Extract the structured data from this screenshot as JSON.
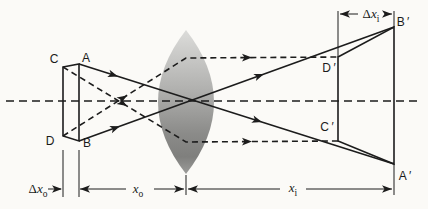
{
  "figure": {
    "canvas": {
      "width": 428,
      "height": 209,
      "background": "#fbfaf7"
    },
    "style": {
      "ink": "#1c1c1c",
      "thin_stroke": 1,
      "main_stroke": 1.6,
      "dash_ray": "6 4",
      "dash_axis": "8 5",
      "arrow_len": 10,
      "arrow_halfwidth": 3.8,
      "lens_gradient": [
        {
          "offset": "0%",
          "color": "#dcdcda"
        },
        {
          "offset": "40%",
          "color": "#b2b2b0"
        },
        {
          "offset": "72%",
          "color": "#8b8b89"
        },
        {
          "offset": "88%",
          "color": "#7f7f7d"
        },
        {
          "offset": "100%",
          "color": "#9c9c9a"
        }
      ]
    },
    "lens": {
      "name": "lens",
      "cx": 186,
      "top": 30,
      "bottom": 174,
      "half_width": 28
    },
    "axis": {
      "name": "optical-axis",
      "y": 101,
      "x1": 6,
      "x2": 422
    },
    "shapes": [
      {
        "name": "object-outline",
        "path": [
          [
            63,
            67
          ],
          [
            79,
            64
          ],
          [
            79,
            141
          ],
          [
            63,
            136
          ]
        ],
        "closed": true
      },
      {
        "name": "image-outline",
        "path": [
          [
            338,
            57
          ],
          [
            394,
            27
          ],
          [
            394,
            164
          ],
          [
            338,
            141
          ]
        ],
        "closed": true
      }
    ],
    "rays": [
      {
        "name": "ray-A-to-A-prime",
        "style": "solid",
        "points": [
          [
            79,
            64
          ],
          [
            394,
            164
          ]
        ],
        "arrows_x": [
          118,
          262
        ]
      },
      {
        "name": "ray-B-to-B-prime",
        "style": "solid",
        "points": [
          [
            79,
            141
          ],
          [
            394,
            27
          ]
        ],
        "arrows_x": [
          120,
          264
        ]
      },
      {
        "name": "ray-C-through-focus",
        "style": "dashed",
        "points": [
          [
            63,
            67
          ],
          [
            186,
            142
          ],
          [
            338,
            141
          ]
        ],
        "arrows_x": [
          127,
          252
        ]
      },
      {
        "name": "ray-D-through-focus",
        "style": "dashed",
        "points": [
          [
            63,
            136
          ],
          [
            186,
            58
          ],
          [
            338,
            57
          ]
        ],
        "arrows_x": [
          127,
          252
        ]
      }
    ],
    "extension_lines": [
      {
        "name": "ext-object-back-face",
        "x1": 63,
        "y1": 150,
        "x2": 63,
        "y2": 197
      },
      {
        "name": "ext-object-front-face",
        "x1": 79,
        "y1": 150,
        "x2": 79,
        "y2": 197
      },
      {
        "name": "ext-lens-center",
        "x1": 186,
        "y1": 175,
        "x2": 186,
        "y2": 195
      },
      {
        "name": "ext-image-front-face",
        "x1": 338,
        "y1": 11,
        "x2": 338,
        "y2": 57
      },
      {
        "name": "ext-image-back-top",
        "x1": 394,
        "y1": 11,
        "x2": 394,
        "y2": 27
      },
      {
        "name": "ext-image-back-bottom",
        "x1": 394,
        "y1": 164,
        "x2": 394,
        "y2": 195
      }
    ],
    "dimension_lines": [
      {
        "name": "dim-delta-xo-line",
        "x1": 48,
        "y1": 189,
        "x2": 61,
        "y2": 189
      },
      {
        "name": "dim-xo-line-left",
        "x1": 80,
        "y1": 189,
        "x2": 126,
        "y2": 189
      },
      {
        "name": "dim-xo-line-right",
        "x1": 154,
        "y1": 189,
        "x2": 184,
        "y2": 189
      },
      {
        "name": "dim-xi-line-left",
        "x1": 188,
        "y1": 189,
        "x2": 280,
        "y2": 189
      },
      {
        "name": "dim-xi-line-right",
        "x1": 306,
        "y1": 189,
        "x2": 392,
        "y2": 189
      },
      {
        "name": "dim-delta-xi-line-left",
        "x1": 340,
        "y1": 14,
        "x2": 358,
        "y2": 14
      },
      {
        "name": "dim-delta-xi-line-right",
        "x1": 385,
        "y1": 14,
        "x2": 392,
        "y2": 14
      }
    ],
    "dimension_arrows": [
      {
        "name": "arrow-delta-xo",
        "x": 62,
        "y": 189,
        "dir": 0
      },
      {
        "name": "arrow-xo-left",
        "x": 80,
        "y": 189,
        "dir": 180
      },
      {
        "name": "arrow-xo-right",
        "x": 184,
        "y": 189,
        "dir": 0
      },
      {
        "name": "arrow-xi-left",
        "x": 188,
        "y": 189,
        "dir": 180
      },
      {
        "name": "arrow-xi-right",
        "x": 392,
        "y": 189,
        "dir": 0
      },
      {
        "name": "arrow-delta-xi-left",
        "x": 340,
        "y": 14,
        "dir": 180
      },
      {
        "name": "arrow-delta-xi-right",
        "x": 392,
        "y": 14,
        "dir": 0
      }
    ],
    "labels": [
      {
        "name": "label-C",
        "x": 54,
        "y": 63,
        "font": "sans",
        "size": 12,
        "parts": [
          {
            "t": "C"
          }
        ]
      },
      {
        "name": "label-A",
        "x": 86,
        "y": 62,
        "font": "sans",
        "size": 12,
        "parts": [
          {
            "t": "A"
          }
        ]
      },
      {
        "name": "label-D",
        "x": 50,
        "y": 145,
        "font": "sans",
        "size": 12,
        "parts": [
          {
            "t": "D"
          }
        ]
      },
      {
        "name": "label-B",
        "x": 87,
        "y": 147,
        "font": "sans",
        "size": 12,
        "parts": [
          {
            "t": "B"
          }
        ]
      },
      {
        "name": "label-D-prime",
        "x": 329,
        "y": 72,
        "font": "sans",
        "size": 12,
        "parts": [
          {
            "t": "D ′"
          }
        ]
      },
      {
        "name": "label-C-prime",
        "x": 327,
        "y": 131,
        "font": "sans",
        "size": 12,
        "parts": [
          {
            "t": "C ′"
          }
        ]
      },
      {
        "name": "label-B-prime",
        "x": 403,
        "y": 26,
        "font": "sans",
        "size": 12,
        "parts": [
          {
            "t": "B ′"
          }
        ]
      },
      {
        "name": "label-A-prime",
        "x": 405,
        "y": 180,
        "font": "sans",
        "size": 12,
        "parts": [
          {
            "t": "A ′"
          }
        ]
      },
      {
        "name": "label-delta-x-o",
        "x": 38,
        "y": 193,
        "font": "serif",
        "size": 13,
        "parts": [
          {
            "t": "Δ"
          },
          {
            "t": "x",
            "italic": true
          },
          {
            "t": "o",
            "sub": true
          }
        ]
      },
      {
        "name": "label-x-o",
        "x": 138,
        "y": 193,
        "font": "serif",
        "size": 13,
        "parts": [
          {
            "t": "x",
            "italic": true
          },
          {
            "t": "o",
            "sub": true
          }
        ]
      },
      {
        "name": "label-x-i",
        "x": 293,
        "y": 192,
        "font": "serif",
        "size": 13,
        "parts": [
          {
            "t": "x",
            "italic": true
          },
          {
            "t": "i",
            "sub": true
          }
        ]
      },
      {
        "name": "label-delta-x-i",
        "x": 371,
        "y": 18,
        "font": "serif",
        "size": 13,
        "parts": [
          {
            "t": "Δ"
          },
          {
            "t": "x",
            "italic": true
          },
          {
            "t": "i",
            "sub": true
          }
        ]
      }
    ]
  }
}
